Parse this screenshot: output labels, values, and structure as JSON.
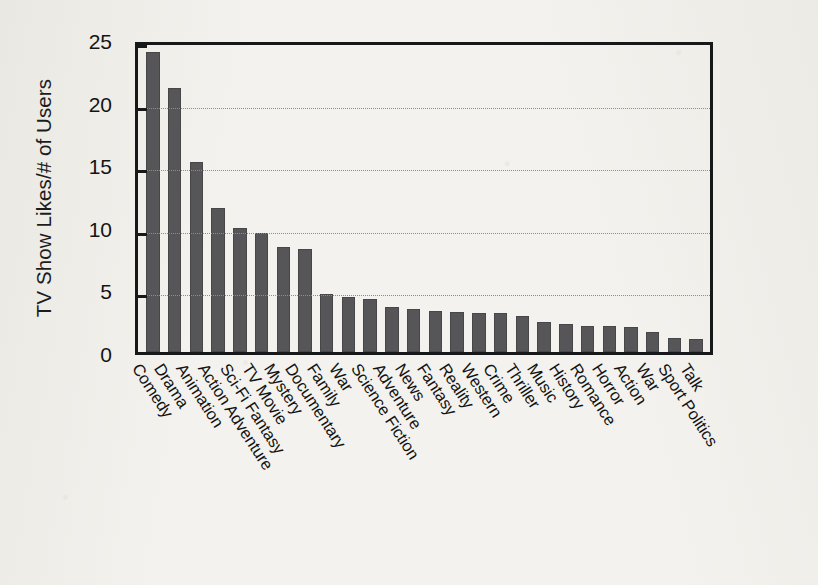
{
  "chart_data": {
    "type": "bar",
    "title": "",
    "xlabel": "",
    "ylabel": "TV Show Likes/# of Users",
    "ylim": [
      0,
      25
    ],
    "yticks": [
      0,
      5,
      10,
      15,
      20,
      25
    ],
    "grid": true,
    "legend": false,
    "legend_position": "none",
    "bar_color": "#565658",
    "axis_color": "#17181a",
    "gridline_color": "#8d8d8d",
    "background_color": "#f3f2ee",
    "categories": [
      "Comedy",
      "Drama",
      "Animation",
      "Action Adventure",
      "Sci-Fi Fantasy",
      "TV Movie",
      "Mystery",
      "Documentary",
      "Family",
      "War",
      "Science Fiction",
      "Adventure",
      "News",
      "Fantasy",
      "Reality",
      "Western",
      "Crime",
      "Thriller",
      "Music",
      "History",
      "Romance",
      "Horror",
      "Action",
      "War",
      "Sport Politics",
      "Talk"
    ],
    "values": [
      24.0,
      21.1,
      15.2,
      11.5,
      9.9,
      9.5,
      8.4,
      8.2,
      4.6,
      4.4,
      4.2,
      3.6,
      3.4,
      3.3,
      3.2,
      3.1,
      3.1,
      2.9,
      2.4,
      2.2,
      2.1,
      2.1,
      2.0,
      1.6,
      1.1,
      1.0
    ]
  }
}
